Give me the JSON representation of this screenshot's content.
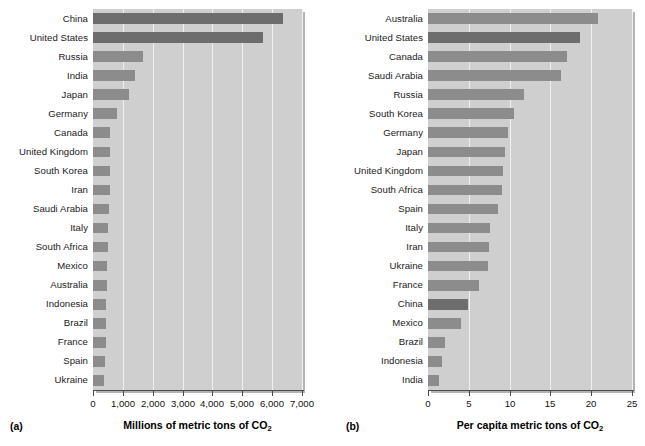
{
  "figure": {
    "background": "#ffffff",
    "bar_color": "#8c8c8c",
    "bar_highlight_color": "#6d6d6d",
    "plot_background": "#cfcfcf",
    "gridline_color": "#f0f0f0"
  },
  "panels": [
    {
      "tag": "(a)",
      "axis_title_main": "Millions of metric tons of CO",
      "axis_title_sub": "2"
    },
    {
      "tag": "(b)",
      "axis_title_main": "Per capita metric tons of CO",
      "axis_title_sub": "2"
    }
  ],
  "chart_data": [
    {
      "type": "bar",
      "orientation": "horizontal",
      "title": "",
      "xlabel": "Millions of metric tons of CO2",
      "ylabel": "",
      "xlim": [
        0,
        7000
      ],
      "xticks": [
        0,
        1000,
        2000,
        3000,
        4000,
        5000,
        6000,
        7000
      ],
      "xticklabels": [
        "0",
        "1,000",
        "2,000",
        "3,000",
        "4,000",
        "5,000",
        "6,000",
        "7,000"
      ],
      "grid": true,
      "legend": "none",
      "highlighted": [
        "China",
        "United States"
      ],
      "categories": [
        "China",
        "United States",
        "Russia",
        "India",
        "Japan",
        "Germany",
        "Canada",
        "United Kingdom",
        "South Korea",
        "Iran",
        "Saudi Arabia",
        "Italy",
        "South Africa",
        "Mexico",
        "Australia",
        "Indonesia",
        "Brazil",
        "France",
        "Spain",
        "Ukraine"
      ],
      "values": [
        6380,
        5700,
        1670,
        1410,
        1220,
        800,
        570,
        560,
        560,
        560,
        540,
        510,
        500,
        480,
        470,
        450,
        440,
        420,
        400,
        380
      ]
    },
    {
      "type": "bar",
      "orientation": "horizontal",
      "title": "",
      "xlabel": "Per capita metric tons of CO2",
      "ylabel": "",
      "xlim": [
        0,
        25
      ],
      "xticks": [
        0,
        5,
        10,
        15,
        20,
        25
      ],
      "xticklabels": [
        "0",
        "5",
        "10",
        "15",
        "20",
        "25"
      ],
      "grid": true,
      "legend": "none",
      "highlighted": [
        "United States",
        "China"
      ],
      "categories": [
        "Australia",
        "United States",
        "Canada",
        "Saudi Arabia",
        "Russia",
        "South Korea",
        "Germany",
        "Japan",
        "United Kingdom",
        "South Africa",
        "Spain",
        "Italy",
        "Iran",
        "Ukraine",
        "France",
        "China",
        "Mexico",
        "Brazil",
        "Indonesia",
        "India"
      ],
      "values": [
        20.8,
        18.6,
        17.0,
        16.3,
        11.8,
        10.6,
        9.8,
        9.4,
        9.2,
        9.1,
        8.6,
        7.6,
        7.5,
        7.4,
        6.3,
        4.9,
        4.0,
        2.1,
        1.7,
        1.4
      ]
    }
  ]
}
